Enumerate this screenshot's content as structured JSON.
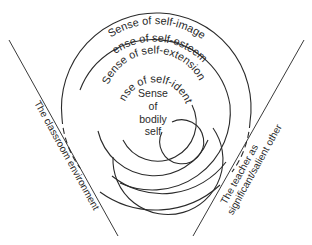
{
  "diagram": {
    "center": {
      "line1": "Sense",
      "line2": "of",
      "line3": "bodily",
      "line4": "self"
    },
    "rings": [
      {
        "label": "Sense of self-identity"
      },
      {
        "label": "Sense of self-extension"
      },
      {
        "label": "Sense of self-esteem"
      },
      {
        "label": "Sense of self-image"
      }
    ],
    "left_boundary": {
      "label": "The classroom environment"
    },
    "right_boundary": {
      "line1": "The teacher as",
      "line2": "significant/salient other"
    },
    "colors": {
      "ink": "#2a2a2a",
      "background": "#ffffff"
    }
  }
}
